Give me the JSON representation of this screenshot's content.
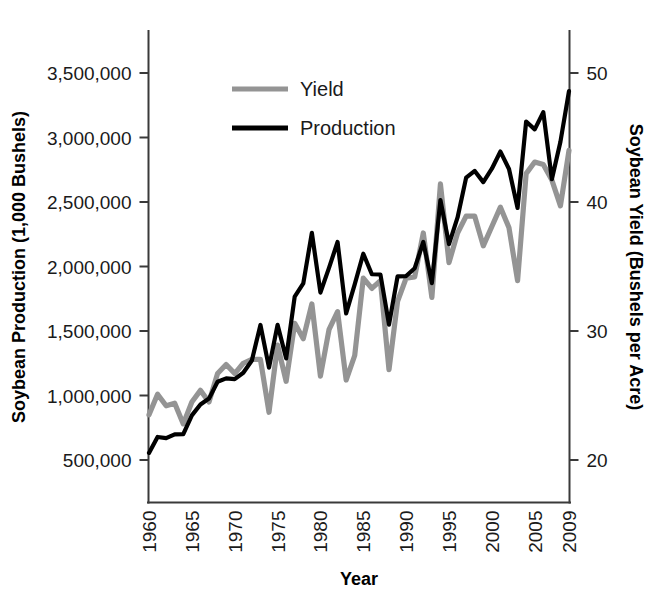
{
  "chart_data": {
    "type": "line",
    "title": "",
    "xlabel": "Year",
    "ylabel": "Soybean Production (1,000 Bushels)",
    "y2label": "Soybean Yield (Bushels per Acre)",
    "grid": false,
    "legend_position": "top-center",
    "xlim": [
      1960,
      2009
    ],
    "ylim": [
      0,
      3750000
    ],
    "y2lim": [
      15.1,
      53.4
    ],
    "xticks": [
      1960,
      1965,
      1970,
      1975,
      1980,
      1985,
      1990,
      1995,
      2000,
      2005,
      2009
    ],
    "xtick_labels": [
      "1960",
      "1965",
      "1970",
      "1975",
      "1980",
      "1985",
      "1990",
      "1995",
      "2000",
      "2005",
      "2009"
    ],
    "yticks": [
      500000,
      1000000,
      1500000,
      2000000,
      2500000,
      3000000,
      3500000
    ],
    "ytick_labels": [
      "500,000",
      "1,000,000",
      "1,500,000",
      "2,000,000",
      "2,500,000",
      "3,000,000",
      "3,500,000"
    ],
    "y2ticks": [
      20,
      30,
      40,
      50
    ],
    "y2tick_labels": [
      "20",
      "30",
      "40",
      "50"
    ],
    "x": [
      1960,
      1961,
      1962,
      1963,
      1964,
      1965,
      1966,
      1967,
      1968,
      1969,
      1970,
      1971,
      1972,
      1973,
      1974,
      1975,
      1976,
      1977,
      1978,
      1979,
      1980,
      1981,
      1982,
      1983,
      1984,
      1985,
      1986,
      1987,
      1988,
      1989,
      1990,
      1991,
      1992,
      1993,
      1994,
      1995,
      1996,
      1997,
      1998,
      1999,
      2000,
      2001,
      2002,
      2003,
      2004,
      2005,
      2006,
      2007,
      2008,
      2009
    ],
    "series": [
      {
        "name": "Production",
        "axis": "left",
        "color": "#000000",
        "units": "1,000 Bushels",
        "values": [
          555000,
          678600,
          669000,
          699000,
          700000,
          845600,
          930000,
          976000,
          1107000,
          1133000,
          1127000,
          1176000,
          1271000,
          1547000,
          1216000,
          1548000,
          1288000,
          1767000,
          1869000,
          2261000,
          1798000,
          1989000,
          2190000,
          1636000,
          1861000,
          2099000,
          1940000,
          1938000,
          1549000,
          1924000,
          1926000,
          1987000,
          2190000,
          1871000,
          2515000,
          2174000,
          2380000,
          2689000,
          2741000,
          2654000,
          2758000,
          2891000,
          2756000,
          2454000,
          3124000,
          3063000,
          3197000,
          2677000,
          2967000,
          3359000
        ]
      },
      {
        "name": "Yield",
        "axis": "right",
        "color": "#949494",
        "units": "Bushels per Acre",
        "values": [
          23.5,
          25.1,
          24.2,
          24.4,
          22.8,
          24.5,
          25.4,
          24.5,
          26.7,
          27.4,
          26.7,
          27.5,
          27.8,
          27.8,
          23.7,
          28.9,
          26.1,
          30.6,
          29.4,
          32.1,
          26.5,
          30.1,
          31.5,
          26.2,
          28.1,
          34.1,
          33.3,
          33.9,
          27.0,
          32.3,
          34.1,
          34.2,
          37.6,
          32.6,
          41.4,
          35.3,
          37.6,
          38.9,
          38.9,
          36.6,
          38.1,
          39.6,
          38.0,
          33.9,
          42.2,
          43.1,
          42.9,
          41.7,
          39.7,
          44.0
        ]
      }
    ],
    "legend": [
      {
        "label": "Yield",
        "color": "#949494"
      },
      {
        "label": "Production",
        "color": "#000000"
      }
    ]
  },
  "axes": {
    "left_title": "Soybean Production (1,000 Bushels)",
    "right_title": "Soybean Yield (Bushels per Acre)",
    "bottom_title": "Year"
  }
}
